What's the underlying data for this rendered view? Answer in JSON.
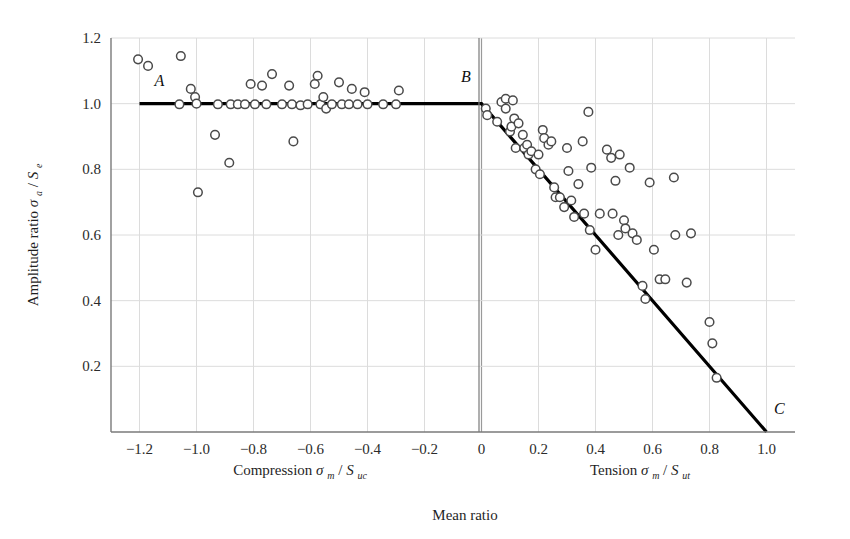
{
  "chart_data": {
    "type": "scatter",
    "title": "",
    "xlabel": "Mean ratio",
    "ylabel": "Amplitude ratio",
    "ylabel_symbol_main": "σ",
    "ylabel_symbol_sub": "a",
    "ylabel_symbol_den": "S",
    "ylabel_symbol_den_sub": "e",
    "xlabel_left": "Compression",
    "xlabel_left_sym_main": "σ",
    "xlabel_left_sym_sub": "m",
    "xlabel_left_den": "S",
    "xlabel_left_den_sub": "uc",
    "xlabel_right": "Tension",
    "xlabel_right_sym_main": "σ",
    "xlabel_right_sym_sub": "m",
    "xlabel_right_den": "S",
    "xlabel_right_den_sub": "ut",
    "xlim": [
      -1.3,
      1.1
    ],
    "ylim": [
      0.0,
      1.2
    ],
    "xticks": [
      -1.2,
      -1.0,
      -0.8,
      -0.6,
      -0.4,
      -0.2,
      0,
      0.2,
      0.4,
      0.6,
      0.8,
      1.0
    ],
    "xtick_labels": [
      "−1.2",
      "−1.0",
      "−0.8",
      "−0.6",
      "−0.4",
      "−0.2",
      "0",
      "0.2",
      "0.4",
      "0.6",
      "0.8",
      "1.0"
    ],
    "yticks": [
      0.2,
      0.4,
      0.6,
      0.8,
      1.0,
      1.2
    ],
    "ytick_labels": [
      "0.2",
      "0.4",
      "0.6",
      "0.8",
      "1.0",
      "1.2"
    ],
    "grid": true,
    "legend": "none",
    "marker": "open-circle",
    "marker_color": "#ffffff",
    "marker_edge_color": "#4a4a4a",
    "line_color": "#000000",
    "annotations": [
      {
        "label": "A",
        "x": -1.13,
        "y": 1.055
      },
      {
        "label": "B",
        "x": -0.055,
        "y": 1.065
      },
      {
        "label": "C",
        "x": 1.045,
        "y": 0.055
      }
    ],
    "criterion_line": {
      "name": "Goodman failure criterion",
      "points": [
        {
          "x": -1.2,
          "y": 1.0
        },
        {
          "x": 0.0,
          "y": 1.0
        },
        {
          "x": 1.0,
          "y": 0.0
        }
      ]
    },
    "points": [
      {
        "x": -1.205,
        "y": 1.135
      },
      {
        "x": -1.17,
        "y": 1.115
      },
      {
        "x": -1.055,
        "y": 1.145
      },
      {
        "x": -1.06,
        "y": 0.998
      },
      {
        "x": -1.02,
        "y": 1.045
      },
      {
        "x": -1.005,
        "y": 1.02
      },
      {
        "x": -1.0,
        "y": 1.0
      },
      {
        "x": -0.995,
        "y": 0.73
      },
      {
        "x": -0.935,
        "y": 0.905
      },
      {
        "x": -0.925,
        "y": 0.998
      },
      {
        "x": -0.885,
        "y": 0.82
      },
      {
        "x": -0.88,
        "y": 0.998
      },
      {
        "x": -0.855,
        "y": 0.998
      },
      {
        "x": -0.83,
        "y": 0.998
      },
      {
        "x": -0.81,
        "y": 1.06
      },
      {
        "x": -0.795,
        "y": 0.998
      },
      {
        "x": -0.77,
        "y": 1.055
      },
      {
        "x": -0.755,
        "y": 0.998
      },
      {
        "x": -0.735,
        "y": 1.09
      },
      {
        "x": -0.7,
        "y": 0.998
      },
      {
        "x": -0.675,
        "y": 1.055
      },
      {
        "x": -0.665,
        "y": 0.998
      },
      {
        "x": -0.66,
        "y": 0.885
      },
      {
        "x": -0.635,
        "y": 0.995
      },
      {
        "x": -0.61,
        "y": 0.998
      },
      {
        "x": -0.585,
        "y": 1.06
      },
      {
        "x": -0.575,
        "y": 1.085
      },
      {
        "x": -0.565,
        "y": 0.998
      },
      {
        "x": -0.555,
        "y": 1.02
      },
      {
        "x": -0.545,
        "y": 0.985
      },
      {
        "x": -0.525,
        "y": 0.998
      },
      {
        "x": -0.5,
        "y": 1.065
      },
      {
        "x": -0.49,
        "y": 0.998
      },
      {
        "x": -0.465,
        "y": 0.998
      },
      {
        "x": -0.455,
        "y": 1.045
      },
      {
        "x": -0.435,
        "y": 0.998
      },
      {
        "x": -0.41,
        "y": 1.035
      },
      {
        "x": -0.4,
        "y": 0.998
      },
      {
        "x": -0.345,
        "y": 0.998
      },
      {
        "x": -0.3,
        "y": 0.998
      },
      {
        "x": -0.29,
        "y": 1.04
      },
      {
        "x": 0.015,
        "y": 0.985
      },
      {
        "x": 0.02,
        "y": 0.965
      },
      {
        "x": 0.055,
        "y": 0.945
      },
      {
        "x": 0.07,
        "y": 1.005
      },
      {
        "x": 0.085,
        "y": 1.015
      },
      {
        "x": 0.085,
        "y": 0.985
      },
      {
        "x": 0.1,
        "y": 0.915
      },
      {
        "x": 0.105,
        "y": 0.93
      },
      {
        "x": 0.11,
        "y": 1.01
      },
      {
        "x": 0.115,
        "y": 0.955
      },
      {
        "x": 0.12,
        "y": 0.865
      },
      {
        "x": 0.13,
        "y": 0.94
      },
      {
        "x": 0.145,
        "y": 0.905
      },
      {
        "x": 0.15,
        "y": 0.865
      },
      {
        "x": 0.16,
        "y": 0.875
      },
      {
        "x": 0.165,
        "y": 0.845
      },
      {
        "x": 0.175,
        "y": 0.855
      },
      {
        "x": 0.19,
        "y": 0.8
      },
      {
        "x": 0.2,
        "y": 0.845
      },
      {
        "x": 0.205,
        "y": 0.785
      },
      {
        "x": 0.215,
        "y": 0.92
      },
      {
        "x": 0.22,
        "y": 0.895
      },
      {
        "x": 0.235,
        "y": 0.875
      },
      {
        "x": 0.245,
        "y": 0.885
      },
      {
        "x": 0.255,
        "y": 0.745
      },
      {
        "x": 0.26,
        "y": 0.715
      },
      {
        "x": 0.275,
        "y": 0.715
      },
      {
        "x": 0.29,
        "y": 0.685
      },
      {
        "x": 0.3,
        "y": 0.865
      },
      {
        "x": 0.305,
        "y": 0.795
      },
      {
        "x": 0.315,
        "y": 0.705
      },
      {
        "x": 0.325,
        "y": 0.655
      },
      {
        "x": 0.34,
        "y": 0.755
      },
      {
        "x": 0.355,
        "y": 0.885
      },
      {
        "x": 0.36,
        "y": 0.665
      },
      {
        "x": 0.375,
        "y": 0.975
      },
      {
        "x": 0.38,
        "y": 0.615
      },
      {
        "x": 0.385,
        "y": 0.805
      },
      {
        "x": 0.4,
        "y": 0.555
      },
      {
        "x": 0.415,
        "y": 0.665
      },
      {
        "x": 0.44,
        "y": 0.86
      },
      {
        "x": 0.455,
        "y": 0.835
      },
      {
        "x": 0.46,
        "y": 0.665
      },
      {
        "x": 0.47,
        "y": 0.765
      },
      {
        "x": 0.48,
        "y": 0.6
      },
      {
        "x": 0.485,
        "y": 0.845
      },
      {
        "x": 0.5,
        "y": 0.645
      },
      {
        "x": 0.505,
        "y": 0.62
      },
      {
        "x": 0.52,
        "y": 0.805
      },
      {
        "x": 0.53,
        "y": 0.605
      },
      {
        "x": 0.545,
        "y": 0.585
      },
      {
        "x": 0.565,
        "y": 0.445
      },
      {
        "x": 0.575,
        "y": 0.405
      },
      {
        "x": 0.59,
        "y": 0.76
      },
      {
        "x": 0.605,
        "y": 0.555
      },
      {
        "x": 0.625,
        "y": 0.465
      },
      {
        "x": 0.645,
        "y": 0.465
      },
      {
        "x": 0.675,
        "y": 0.775
      },
      {
        "x": 0.68,
        "y": 0.6
      },
      {
        "x": 0.72,
        "y": 0.455
      },
      {
        "x": 0.735,
        "y": 0.605
      },
      {
        "x": 0.8,
        "y": 0.335
      },
      {
        "x": 0.81,
        "y": 0.27
      },
      {
        "x": 0.825,
        "y": 0.165
      }
    ]
  }
}
